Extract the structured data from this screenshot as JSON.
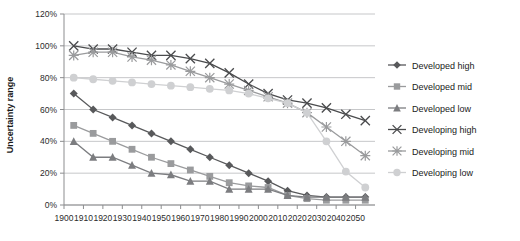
{
  "chart_data": {
    "type": "line",
    "title": "",
    "xlabel": "",
    "ylabel": "Uncertainty range",
    "xlim": [
      1900,
      2060
    ],
    "ylim": [
      0,
      1.2
    ],
    "grid": true,
    "legend_position": "right",
    "x_tick_labels": [
      "1900",
      "1910",
      "1920",
      "1930",
      "1940",
      "1950",
      "1960",
      "1970",
      "1980",
      "1990",
      "2000",
      "2010",
      "2020",
      "2030",
      "2040",
      "2050"
    ],
    "x_tick_values": [
      1900,
      1910,
      1920,
      1930,
      1940,
      1950,
      1960,
      1970,
      1980,
      1990,
      2000,
      2010,
      2020,
      2030,
      2040,
      2050
    ],
    "y_tick_labels": [
      "0%",
      "20%",
      "40%",
      "60%",
      "80%",
      "100%",
      "120%"
    ],
    "y_tick_values": [
      0,
      0.2,
      0.4,
      0.6,
      0.8,
      1.0,
      1.2
    ],
    "x": [
      1905,
      1915,
      1925,
      1935,
      1945,
      1955,
      1965,
      1975,
      1985,
      1995,
      2005,
      2015,
      2025,
      2035,
      2045,
      2055
    ],
    "series": [
      {
        "name": "Developed high",
        "color": "#58595b",
        "marker": "diamond",
        "values": [
          0.7,
          0.6,
          0.55,
          0.5,
          0.45,
          0.4,
          0.35,
          0.3,
          0.25,
          0.2,
          0.15,
          0.09,
          0.06,
          0.05,
          0.05,
          0.05
        ]
      },
      {
        "name": "Developed mid",
        "color": "#9a9b9d",
        "marker": "square",
        "values": [
          0.5,
          0.45,
          0.4,
          0.35,
          0.3,
          0.26,
          0.22,
          0.18,
          0.14,
          0.12,
          0.11,
          0.06,
          0.04,
          0.03,
          0.03,
          0.03
        ]
      },
      {
        "name": "Developed low",
        "color": "#7c7d80",
        "marker": "triangle",
        "values": [
          0.4,
          0.3,
          0.3,
          0.25,
          0.2,
          0.19,
          0.15,
          0.15,
          0.1,
          0.1,
          0.1,
          0.06,
          0.05,
          0.05,
          0.05,
          0.05
        ]
      },
      {
        "name": "Developing high",
        "color": "#4a4b4d",
        "marker": "x",
        "values": [
          1.0,
          0.98,
          0.98,
          0.96,
          0.94,
          0.94,
          0.92,
          0.89,
          0.83,
          0.76,
          0.7,
          0.66,
          0.64,
          0.61,
          0.57,
          0.53
        ]
      },
      {
        "name": "Developing mid",
        "color": "#9a9b9d",
        "marker": "star",
        "values": [
          0.94,
          0.96,
          0.96,
          0.93,
          0.91,
          0.88,
          0.84,
          0.8,
          0.76,
          0.72,
          0.68,
          0.64,
          0.58,
          0.49,
          0.4,
          0.31
        ]
      },
      {
        "name": "Developing low",
        "color": "#cfd0d2",
        "marker": "circle",
        "values": [
          0.8,
          0.79,
          0.78,
          0.77,
          0.76,
          0.75,
          0.74,
          0.73,
          0.72,
          0.7,
          0.67,
          0.64,
          0.58,
          0.4,
          0.21,
          0.11
        ]
      }
    ]
  },
  "axis": {
    "y_title": "Uncertainty range"
  },
  "colors": {
    "grid": "#c6c7c9",
    "axis": "#8c8d8f",
    "text": "#1a1a1a",
    "background": "#ffffff"
  }
}
